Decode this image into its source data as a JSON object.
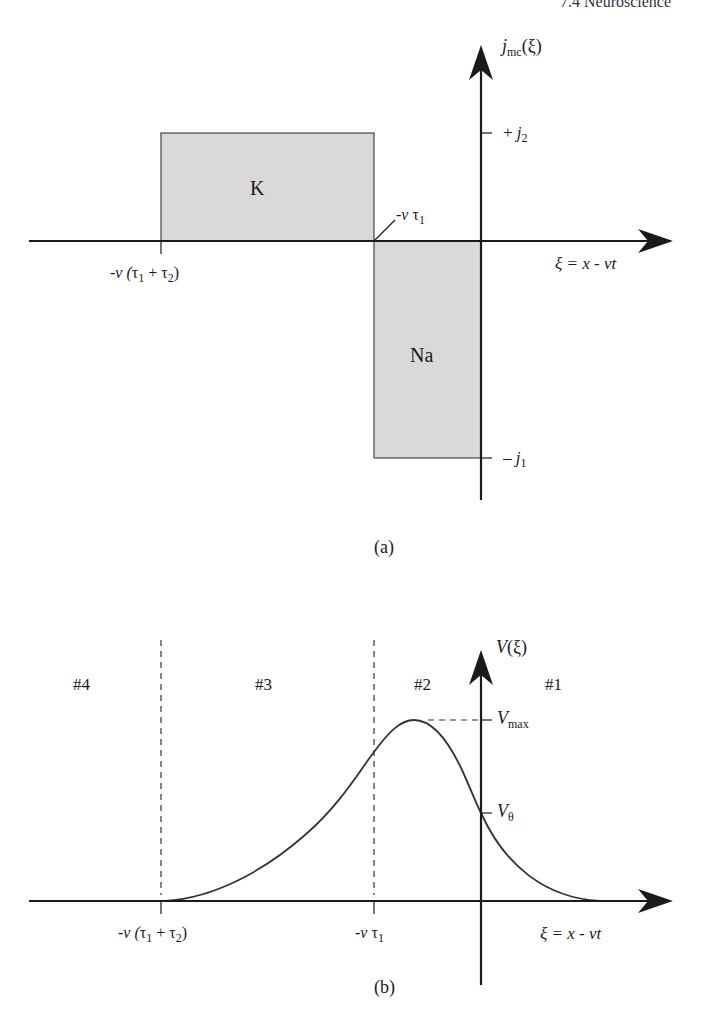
{
  "header": {
    "running_head": "7.4 Neuroscience"
  },
  "figure_a": {
    "caption": "(a)",
    "y_axis_label": {
      "main": "j",
      "sub": "mc",
      "arg": "(ξ)"
    },
    "x_axis_label": "ξ = x - vt",
    "ticks_y": [
      {
        "id": "plus_j2",
        "sign": "+",
        "var": "j",
        "sub": "2"
      },
      {
        "id": "minus_j1",
        "sign": "–",
        "var": "j",
        "sub": "1"
      }
    ],
    "ticks_x": [
      {
        "id": "v_tau1_tau2",
        "prefix": "-v (",
        "t1": "τ",
        "s1": "1",
        "plus": " + ",
        "t2": "τ",
        "s2": "2",
        "suffix": ")"
      },
      {
        "id": "v_tau1",
        "prefix": "-v ",
        "t1": "τ",
        "s1": "1"
      }
    ],
    "regions": [
      {
        "label": "K",
        "sign": "positive",
        "fill": "#d9d9d9"
      },
      {
        "label": "Na",
        "sign": "negative",
        "fill": "#d9d9d9"
      }
    ]
  },
  "figure_b": {
    "caption": "(b)",
    "y_axis_label": {
      "main": "V",
      "arg": "(ξ)"
    },
    "x_axis_label": "ξ = x - vt",
    "ticks_y": [
      {
        "id": "v_max",
        "var": "V",
        "sub": "max"
      },
      {
        "id": "v_theta",
        "var": "V",
        "sub": "θ"
      }
    ],
    "ticks_x": [
      {
        "id": "v_tau1_tau2",
        "prefix": "-v (",
        "t1": "τ",
        "s1": "1",
        "plus": " + ",
        "t2": "τ",
        "s2": "2",
        "suffix": ")"
      },
      {
        "id": "v_tau1",
        "prefix": "-v ",
        "t1": "τ",
        "s1": "1"
      }
    ],
    "regions": [
      "#4",
      "#3",
      "#2",
      "#1"
    ]
  },
  "colors": {
    "ink": "#1a1a1a",
    "fill": "#d9d9d9",
    "background": "#ffffff"
  }
}
